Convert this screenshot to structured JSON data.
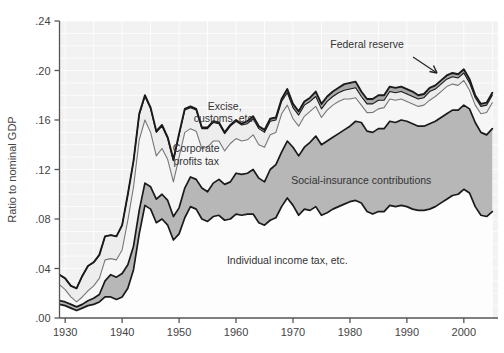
{
  "chart_data": {
    "type": "area",
    "title": "",
    "subtitle": "",
    "xlabel": "",
    "ylabel": "Ratio to nominal GDP",
    "xlim": [
      1929,
      2006
    ],
    "ylim": [
      0.0,
      0.24
    ],
    "grid": true,
    "legend_position": "inline-annotations",
    "x_ticks": [
      1930,
      1940,
      1950,
      1960,
      1970,
      1980,
      1990,
      2000
    ],
    "x_tick_labels": [
      "1930",
      "1940",
      "1950",
      "1960",
      "1970",
      "1980",
      "1990",
      "2000"
    ],
    "y_ticks": [
      0.0,
      0.04,
      0.08,
      0.12,
      0.16,
      0.2,
      0.24
    ],
    "y_tick_labels": [
      ".00",
      ".04",
      ".08",
      ".12",
      ".16",
      ".20",
      ".24"
    ],
    "stacked": true,
    "annotations": [
      {
        "text": "Federal reserve",
        "x": 1983,
        "y": 0.218,
        "arrow": true
      },
      {
        "text": "Excise,",
        "x": 1958,
        "y": 0.168
      },
      {
        "text": "customs, etc.",
        "x": 1958,
        "y": 0.158
      },
      {
        "text": "Corporate",
        "x": 1953,
        "y": 0.134
      },
      {
        "text": "profits tax",
        "x": 1953,
        "y": 0.124
      },
      {
        "text": "Social-insurance contributions",
        "x": 1982,
        "y": 0.108
      },
      {
        "text": "Individual income tax, etc.",
        "x": 1969,
        "y": 0.044
      }
    ],
    "colors": {
      "individual_income_tax": "#fdfdfd",
      "social_insurance": "#b7b7b7",
      "corporate_profits_tax": "#f6f6f6",
      "excise_customs": "#ededed",
      "federal_reserve": "#a8a8a8",
      "outline_dark": "#1a1a1a",
      "outline_mid": "#777777",
      "plot_background": "#f2f2f2",
      "grid": "#ffffff",
      "axis": "#555555",
      "text": "#3c3c3c"
    },
    "x": [
      1929,
      1930,
      1931,
      1932,
      1933,
      1934,
      1935,
      1936,
      1937,
      1938,
      1939,
      1940,
      1941,
      1942,
      1943,
      1944,
      1945,
      1946,
      1947,
      1948,
      1949,
      1950,
      1951,
      1952,
      1953,
      1954,
      1955,
      1956,
      1957,
      1958,
      1959,
      1960,
      1961,
      1962,
      1963,
      1964,
      1965,
      1966,
      1967,
      1968,
      1969,
      1970,
      1971,
      1972,
      1973,
      1974,
      1975,
      1976,
      1977,
      1978,
      1979,
      1980,
      1981,
      1982,
      1983,
      1984,
      1985,
      1986,
      1987,
      1988,
      1989,
      1990,
      1991,
      1992,
      1993,
      1994,
      1995,
      1996,
      1997,
      1998,
      1999,
      2000,
      2001,
      2002,
      2003,
      2004,
      2005
    ],
    "series": [
      {
        "name": "Individual income tax, etc.",
        "fill": "#fdfdfd",
        "values": [
          0.011,
          0.01,
          0.008,
          0.006,
          0.008,
          0.01,
          0.011,
          0.013,
          0.017,
          0.017,
          0.015,
          0.017,
          0.024,
          0.039,
          0.068,
          0.091,
          0.088,
          0.077,
          0.08,
          0.075,
          0.063,
          0.068,
          0.081,
          0.09,
          0.088,
          0.08,
          0.078,
          0.082,
          0.083,
          0.079,
          0.08,
          0.084,
          0.083,
          0.084,
          0.084,
          0.077,
          0.075,
          0.079,
          0.081,
          0.09,
          0.097,
          0.091,
          0.083,
          0.088,
          0.087,
          0.09,
          0.083,
          0.085,
          0.088,
          0.09,
          0.092,
          0.094,
          0.095,
          0.093,
          0.086,
          0.084,
          0.086,
          0.086,
          0.091,
          0.09,
          0.091,
          0.09,
          0.088,
          0.087,
          0.087,
          0.088,
          0.09,
          0.093,
          0.096,
          0.099,
          0.1,
          0.104,
          0.101,
          0.09,
          0.083,
          0.082,
          0.086
        ]
      },
      {
        "name": "Social-insurance contributions",
        "fill": "#b7b7b7",
        "values": [
          0.003,
          0.003,
          0.003,
          0.003,
          0.003,
          0.004,
          0.005,
          0.006,
          0.013,
          0.018,
          0.018,
          0.019,
          0.019,
          0.019,
          0.019,
          0.018,
          0.018,
          0.019,
          0.02,
          0.02,
          0.019,
          0.021,
          0.024,
          0.024,
          0.024,
          0.025,
          0.024,
          0.027,
          0.029,
          0.029,
          0.03,
          0.033,
          0.033,
          0.033,
          0.036,
          0.036,
          0.035,
          0.041,
          0.043,
          0.044,
          0.046,
          0.047,
          0.048,
          0.05,
          0.055,
          0.057,
          0.057,
          0.058,
          0.058,
          0.059,
          0.06,
          0.061,
          0.064,
          0.065,
          0.065,
          0.066,
          0.067,
          0.067,
          0.068,
          0.068,
          0.069,
          0.069,
          0.069,
          0.068,
          0.068,
          0.069,
          0.069,
          0.069,
          0.069,
          0.069,
          0.068,
          0.068,
          0.068,
          0.068,
          0.067,
          0.066,
          0.067
        ]
      },
      {
        "name": "Corporate profits tax",
        "fill": "#f6f6f6",
        "values": [
          0.013,
          0.01,
          0.006,
          0.004,
          0.006,
          0.008,
          0.01,
          0.013,
          0.017,
          0.013,
          0.014,
          0.019,
          0.036,
          0.048,
          0.057,
          0.051,
          0.044,
          0.035,
          0.037,
          0.033,
          0.028,
          0.041,
          0.045,
          0.039,
          0.039,
          0.032,
          0.036,
          0.034,
          0.031,
          0.027,
          0.031,
          0.028,
          0.027,
          0.027,
          0.028,
          0.027,
          0.028,
          0.028,
          0.026,
          0.031,
          0.029,
          0.023,
          0.024,
          0.025,
          0.025,
          0.024,
          0.022,
          0.025,
          0.026,
          0.026,
          0.025,
          0.022,
          0.019,
          0.014,
          0.015,
          0.016,
          0.016,
          0.017,
          0.018,
          0.018,
          0.017,
          0.016,
          0.016,
          0.016,
          0.017,
          0.019,
          0.02,
          0.021,
          0.022,
          0.021,
          0.02,
          0.02,
          0.015,
          0.014,
          0.015,
          0.018,
          0.021
        ]
      },
      {
        "name": "Excise, customs, etc.",
        "fill": "#ededed",
        "values": [
          0.008,
          0.009,
          0.009,
          0.011,
          0.017,
          0.02,
          0.019,
          0.019,
          0.019,
          0.019,
          0.019,
          0.02,
          0.021,
          0.021,
          0.02,
          0.019,
          0.019,
          0.019,
          0.018,
          0.017,
          0.017,
          0.018,
          0.018,
          0.017,
          0.017,
          0.016,
          0.015,
          0.015,
          0.014,
          0.014,
          0.014,
          0.014,
          0.013,
          0.013,
          0.013,
          0.013,
          0.012,
          0.011,
          0.01,
          0.01,
          0.01,
          0.009,
          0.009,
          0.009,
          0.008,
          0.008,
          0.007,
          0.007,
          0.007,
          0.007,
          0.007,
          0.008,
          0.008,
          0.007,
          0.007,
          0.007,
          0.007,
          0.006,
          0.006,
          0.006,
          0.006,
          0.006,
          0.006,
          0.006,
          0.006,
          0.007,
          0.006,
          0.006,
          0.006,
          0.006,
          0.006,
          0.006,
          0.006,
          0.006,
          0.006,
          0.006,
          0.006
        ]
      },
      {
        "name": "Federal reserve",
        "fill": "#a8a8a8",
        "values": [
          0.0,
          0.0,
          0.0,
          0.0,
          0.0,
          0.0,
          0.0,
          0.0,
          0.0,
          0.0,
          0.0,
          0.0,
          0.0,
          0.0,
          0.001,
          0.001,
          0.001,
          0.001,
          0.001,
          0.001,
          0.001,
          0.001,
          0.001,
          0.001,
          0.001,
          0.001,
          0.001,
          0.001,
          0.001,
          0.001,
          0.001,
          0.001,
          0.001,
          0.002,
          0.002,
          0.002,
          0.002,
          0.002,
          0.002,
          0.002,
          0.003,
          0.003,
          0.003,
          0.003,
          0.003,
          0.004,
          0.004,
          0.004,
          0.004,
          0.004,
          0.005,
          0.005,
          0.005,
          0.004,
          0.004,
          0.004,
          0.004,
          0.004,
          0.004,
          0.004,
          0.004,
          0.004,
          0.004,
          0.003,
          0.003,
          0.003,
          0.003,
          0.003,
          0.003,
          0.003,
          0.003,
          0.003,
          0.003,
          0.002,
          0.002,
          0.002,
          0.002
        ]
      }
    ]
  }
}
